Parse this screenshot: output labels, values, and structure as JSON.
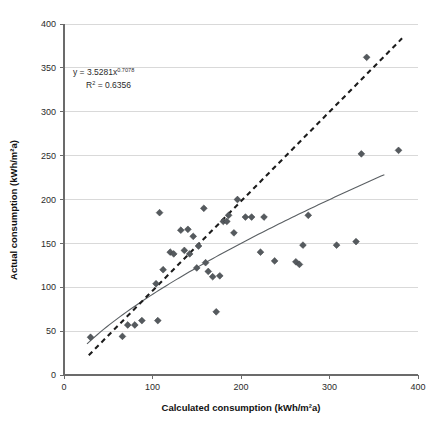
{
  "chart_data": {
    "type": "scatter",
    "title": "",
    "xlabel": "Calculated consumption (kWh/m²a)",
    "ylabel": "Actual consumption (kWh/m²a)",
    "xlim": [
      0,
      400
    ],
    "ylim": [
      0,
      400
    ],
    "xticks": [
      0,
      100,
      200,
      300,
      400
    ],
    "yticks": [
      0,
      50,
      100,
      150,
      200,
      250,
      300,
      350,
      400
    ],
    "grid": "horizontal",
    "legend": "none",
    "annotations": {
      "equation_prefix": "y = 3.5281x",
      "equation_exponent": "0.7078",
      "r_squared_prefix": "R",
      "r_squared_sup": "2",
      "r_squared_value": " = 0.6356"
    },
    "series": [
      {
        "name": "Buildings",
        "marker": "diamond",
        "color": "#555a5e",
        "points": [
          [
            30,
            43
          ],
          [
            66,
            44
          ],
          [
            72,
            57
          ],
          [
            80,
            57
          ],
          [
            88,
            62
          ],
          [
            106,
            62
          ],
          [
            104,
            104
          ],
          [
            112,
            120
          ],
          [
            108,
            185
          ],
          [
            120,
            140
          ],
          [
            124,
            138
          ],
          [
            132,
            165
          ],
          [
            136,
            142
          ],
          [
            140,
            166
          ],
          [
            142,
            138
          ],
          [
            146,
            158
          ],
          [
            150,
            122
          ],
          [
            152,
            147
          ],
          [
            158,
            190
          ],
          [
            160,
            128
          ],
          [
            163,
            118
          ],
          [
            168,
            112
          ],
          [
            172,
            72
          ],
          [
            176,
            113
          ],
          [
            180,
            175
          ],
          [
            184,
            175
          ],
          [
            186,
            182
          ],
          [
            192,
            162
          ],
          [
            196,
            200
          ],
          [
            205,
            180
          ],
          [
            212,
            180
          ],
          [
            222,
            140
          ],
          [
            226,
            180
          ],
          [
            238,
            130
          ],
          [
            262,
            129
          ],
          [
            266,
            126
          ],
          [
            270,
            148
          ],
          [
            276,
            182
          ],
          [
            308,
            148
          ],
          [
            330,
            152
          ],
          [
            336,
            252
          ],
          [
            342,
            362
          ],
          [
            378,
            256
          ]
        ]
      }
    ],
    "fits": [
      {
        "name": "power-trend",
        "style": "solid",
        "type": "power",
        "a": 3.5281,
        "b": 0.7078,
        "x_start": 26,
        "x_end": 362,
        "color": "#5a5f63"
      },
      {
        "name": "parity-trend",
        "style": "dashed",
        "type": "linear",
        "slope": 1.02,
        "intercept": -6,
        "x_start": 28,
        "x_end": 382,
        "color": "#1c1c1c"
      }
    ]
  }
}
